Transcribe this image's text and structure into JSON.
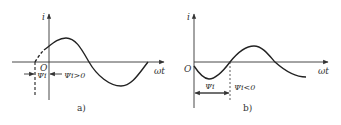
{
  "colors": {
    "background": "#ffffff",
    "ink": "#333333",
    "curve": "#222222"
  },
  "panels": [
    {
      "id": "a",
      "caption": "a)",
      "y_axis_label": "i",
      "x_axis_label": "ωt",
      "origin_label": "O",
      "phase_label": "Ψi",
      "phase_condition": "Ψi>0"
    },
    {
      "id": "b",
      "caption": "b)",
      "y_axis_label": "i",
      "x_axis_label": "ωt",
      "origin_label": "O",
      "phase_label": "Ψi",
      "phase_condition": "Ψi<0"
    }
  ]
}
